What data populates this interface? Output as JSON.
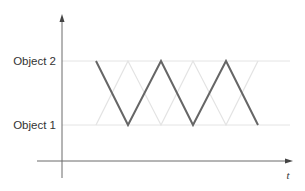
{
  "diagram": {
    "y_labels": [
      "Object 2",
      "Object 1"
    ],
    "x_axis_label": "t",
    "colors": {
      "axis": "#6b6b6b",
      "gridline": "#e4e4e4",
      "active_path": "#666666",
      "alternate_path": "#e6e6e6",
      "text": "#333333"
    },
    "active_path_points": [
      [
        96,
        61
      ],
      [
        128,
        125
      ],
      [
        161,
        61
      ],
      [
        193,
        125
      ],
      [
        226,
        61
      ],
      [
        258,
        125
      ]
    ],
    "alternate_path_points": [
      [
        96,
        125
      ],
      [
        128,
        61
      ],
      [
        161,
        125
      ],
      [
        193,
        61
      ],
      [
        226,
        125
      ],
      [
        258,
        61
      ]
    ]
  }
}
